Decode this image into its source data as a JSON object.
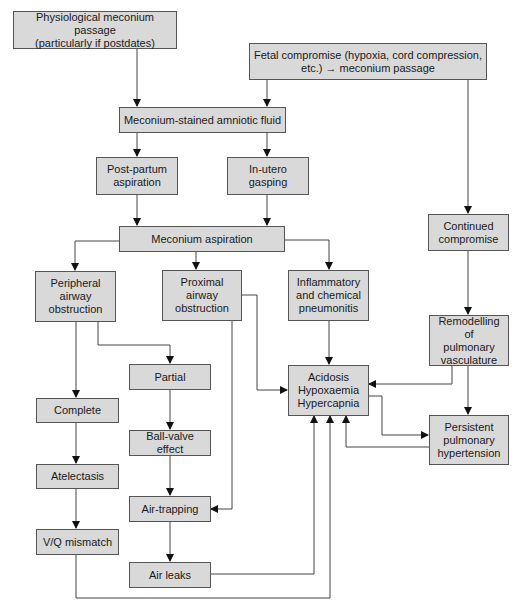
{
  "diagram": {
    "type": "flowchart",
    "nodes": {
      "physiological": "Physiological meconium passage\n(particularly if postdates)",
      "fetal_compromise": "Fetal compromise (hypoxia, cord compression,\netc.) → meconium passage",
      "stained_fluid": "Meconium-stained amniotic fluid",
      "postpartum": "Post-partum\naspiration",
      "inutero": "In-utero\ngasping",
      "aspiration": "Meconium aspiration",
      "peripheral": "Peripheral\nairway\nobstruction",
      "proximal": "Proximal\nairway\nobstruction",
      "inflammatory": "Inflammatory\nand chemical\npneumonitis",
      "continued": "Continued\ncompromise",
      "remodelling": "Remodelling of\npulmonary\nvasculature",
      "acidosis": "Acidosis\nHypoxaemia\nHypercapnia",
      "pphn": "Persistent\npulmonary\nhypertension",
      "complete": "Complete",
      "atelectasis": "Atelectasis",
      "vq": "V/Q mismatch",
      "partial": "Partial",
      "ballvalve": "Ball-valve effect",
      "airtrapping": "Air-trapping",
      "airleaks": "Air leaks"
    },
    "edges": [
      [
        "physiological",
        "stained_fluid"
      ],
      [
        "fetal_compromise",
        "stained_fluid"
      ],
      [
        "fetal_compromise",
        "continued"
      ],
      [
        "stained_fluid",
        "postpartum"
      ],
      [
        "stained_fluid",
        "inutero"
      ],
      [
        "postpartum",
        "aspiration"
      ],
      [
        "inutero",
        "aspiration"
      ],
      [
        "aspiration",
        "peripheral"
      ],
      [
        "aspiration",
        "proximal"
      ],
      [
        "aspiration",
        "inflammatory"
      ],
      [
        "peripheral",
        "complete"
      ],
      [
        "peripheral",
        "partial"
      ],
      [
        "proximal",
        "acidosis"
      ],
      [
        "proximal",
        "airtrapping"
      ],
      [
        "inflammatory",
        "acidosis"
      ],
      [
        "continued",
        "remodelling"
      ],
      [
        "remodelling",
        "acidosis"
      ],
      [
        "remodelling",
        "pphn"
      ],
      [
        "acidosis",
        "pphn"
      ],
      [
        "pphn",
        "acidosis"
      ],
      [
        "complete",
        "atelectasis"
      ],
      [
        "atelectasis",
        "vq"
      ],
      [
        "vq",
        "acidosis"
      ],
      [
        "partial",
        "ballvalve"
      ],
      [
        "ballvalve",
        "airtrapping"
      ],
      [
        "airtrapping",
        "airleaks"
      ],
      [
        "airleaks",
        "acidosis"
      ]
    ]
  }
}
